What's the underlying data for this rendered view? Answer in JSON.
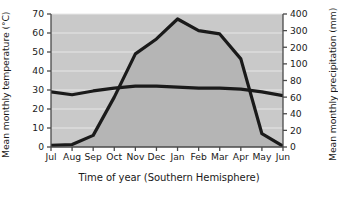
{
  "chart_data": {
    "type": "line",
    "title": "",
    "xlabel": "Time of year (Southern Hemisphere)",
    "ylabel": "Mean monthly temperature (°C)",
    "y2label": "Mean monthly precipitation (mm)",
    "categories": [
      "Jul",
      "Aug",
      "Sep",
      "Oct",
      "Nov",
      "Dec",
      "Jan",
      "Feb",
      "Mar",
      "Apr",
      "May",
      "Jun"
    ],
    "grid": true,
    "legend": "none",
    "yticks": [
      0,
      10,
      20,
      30,
      40,
      50,
      60,
      70
    ],
    "ylim": [
      0,
      70
    ],
    "y2ticks": [
      0,
      20,
      40,
      60,
      80,
      100,
      200,
      300,
      400
    ],
    "y2_scale": "non-linear (equal spacing per tick)",
    "series": [
      {
        "name": "Mean monthly temperature (°C)",
        "axis": "left",
        "unit": "°C",
        "style": "line",
        "color": "#1a1a1a",
        "values": [
          29,
          27.5,
          29.5,
          31,
          32,
          32,
          31.5,
          31,
          31,
          30.5,
          29,
          27
        ]
      },
      {
        "name": "Mean monthly precipitation (mm)",
        "axis": "right",
        "unit": "mm",
        "style": "area",
        "color": "#1a1a1a",
        "fill": "#b5b5b5",
        "values": [
          2,
          3,
          14,
          60,
          160,
          250,
          370,
          300,
          280,
          130,
          16,
          1
        ]
      }
    ],
    "annotations": []
  },
  "axes": {
    "left": {
      "title": "Mean monthly temperature (°C)",
      "labels": [
        "70",
        "60",
        "50",
        "40",
        "30",
        "20",
        "10",
        "0"
      ]
    },
    "right": {
      "title": "Mean monthly precipitation (mm)",
      "labels": [
        "400",
        "300",
        "200",
        "100",
        "80",
        "60",
        "40",
        "20",
        "0"
      ]
    },
    "bottom": {
      "title": "Time of year (Southern Hemisphere)",
      "labels": [
        "Jul",
        "Aug",
        "Sep",
        "Oct",
        "Nov",
        "Dec",
        "Jan",
        "Feb",
        "Mar",
        "Apr",
        "May",
        "Jun"
      ]
    }
  },
  "colors": {
    "plot_background": "#c9c9c9",
    "area_fill": "#b9b9b9",
    "line": "#1a1a1a",
    "gridline": "#e8e8e8",
    "axis": "#4a4a4a",
    "page_background": "#ffffff"
  }
}
